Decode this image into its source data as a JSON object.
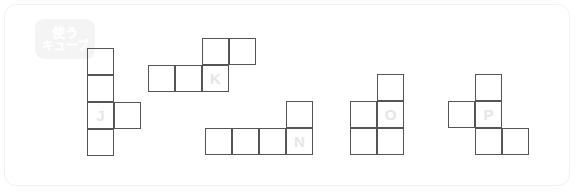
{
  "card": {
    "background": "#ffffff",
    "border_color": "#f2f2f2"
  },
  "badge": {
    "name": "use-cube-badge",
    "background": "#f4f4f4",
    "text_color": "#ffffff",
    "line1": "使う",
    "line2": "キューブ"
  },
  "style": {
    "cell_size": 27,
    "stroke_color": "#555555",
    "label_color": "#e6e6e6"
  },
  "shapes": [
    {
      "label": "J",
      "name": "shape-j",
      "origin": {
        "x": 82,
        "y": 43
      },
      "cells": [
        {
          "col": 0,
          "row": 0
        },
        {
          "col": 0,
          "row": 1
        },
        {
          "col": 0,
          "row": 2
        },
        {
          "col": 1,
          "row": 2
        },
        {
          "col": 0,
          "row": 3
        }
      ],
      "label_cell": {
        "col": 0,
        "row": 2
      }
    },
    {
      "label": "K",
      "name": "shape-k",
      "origin": {
        "x": 143,
        "y": 33
      },
      "cells": [
        {
          "col": 2,
          "row": 0
        },
        {
          "col": 3,
          "row": 0
        },
        {
          "col": 0,
          "row": 1
        },
        {
          "col": 1,
          "row": 1
        },
        {
          "col": 2,
          "row": 1
        }
      ],
      "label_cell": {
        "col": 2,
        "row": 1
      }
    },
    {
      "label": "N",
      "name": "shape-n",
      "origin": {
        "x": 200,
        "y": 96
      },
      "cells": [
        {
          "col": 3,
          "row": 0
        },
        {
          "col": 0,
          "row": 1
        },
        {
          "col": 1,
          "row": 1
        },
        {
          "col": 2,
          "row": 1
        },
        {
          "col": 3,
          "row": 1
        }
      ],
      "label_cell": {
        "col": 3,
        "row": 1
      }
    },
    {
      "label": "O",
      "name": "shape-o",
      "origin": {
        "x": 345,
        "y": 69
      },
      "cells": [
        {
          "col": 1,
          "row": 0
        },
        {
          "col": 0,
          "row": 1
        },
        {
          "col": 1,
          "row": 1
        },
        {
          "col": 0,
          "row": 2
        },
        {
          "col": 1,
          "row": 2
        }
      ],
      "label_cell": {
        "col": 1,
        "row": 1
      }
    },
    {
      "label": "P",
      "name": "shape-p",
      "origin": {
        "x": 443,
        "y": 69
      },
      "cells": [
        {
          "col": 1,
          "row": 0
        },
        {
          "col": 0,
          "row": 1
        },
        {
          "col": 1,
          "row": 1
        },
        {
          "col": 1,
          "row": 2
        },
        {
          "col": 2,
          "row": 2
        }
      ],
      "label_cell": {
        "col": 1,
        "row": 1
      }
    }
  ]
}
